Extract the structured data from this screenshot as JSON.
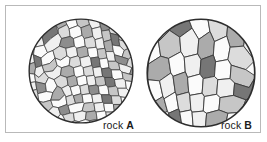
{
  "figure": {
    "background_color": "#ffffff",
    "frame_border_color": "#b9b9b9"
  },
  "specimens": [
    {
      "id": "A",
      "name": "rock",
      "label_full": "rock A",
      "texture": "fine-grained",
      "grain_count": 118,
      "outline_color": "#3a3a3a",
      "shape": "circle"
    },
    {
      "id": "B",
      "name": "rock",
      "label_full": "rock B",
      "texture": "coarse-grained",
      "grain_count": 36,
      "outline_color": "#3a3a3a",
      "shape": "circle"
    }
  ],
  "grain_palette": {
    "white": "#fbfbfb",
    "near_white": "#f0f0f0",
    "light_gray": "#dcdcdc",
    "mid_light_gray": "#c6c6c6",
    "mid_gray": "#ababab",
    "dark_gray": "#8d8d8d",
    "darker_gray": "#767676"
  }
}
